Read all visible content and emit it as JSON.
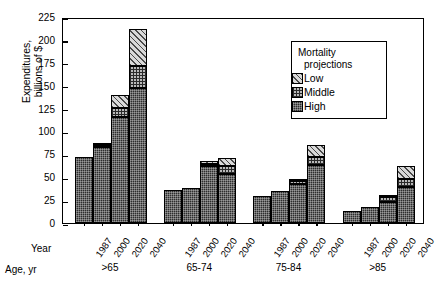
{
  "chart_data": {
    "type": "bar",
    "subtype": "grouped-stacked",
    "title": "",
    "xlabel": "",
    "ylabel": "Expenditures,\nbillions of $",
    "ylim": [
      0,
      225
    ],
    "yticks": [
      0,
      25,
      50,
      75,
      100,
      125,
      150,
      175,
      200,
      225
    ],
    "ytick_labels": [
      "0",
      "25",
      "50",
      "75",
      "100",
      "125",
      "150",
      "175",
      "200",
      "225"
    ],
    "grid": false,
    "legend": {
      "title_line1": "Mortality",
      "title_line2": "projections",
      "position": "top-right-inside",
      "entries": [
        {
          "label": "Low",
          "pattern": "diagonal-hatch",
          "color": "#d9d9d9"
        },
        {
          "label": "Middle",
          "pattern": "checkered",
          "color": "#b9b9b9"
        },
        {
          "label": "High",
          "pattern": "dark-stipple",
          "color": "#2e2e2e"
        }
      ]
    },
    "row_labels": {
      "year": "Year",
      "age": "Age, yr"
    },
    "categories": [
      "1987",
      "2000",
      "2020",
      "2040"
    ],
    "groups": [
      {
        "age_label": ">65",
        "bars": [
          {
            "year": "1987",
            "high": 72,
            "middle": 0,
            "low": 0,
            "total": 72
          },
          {
            "year": "2000",
            "high": 83,
            "middle": 2,
            "low": 1,
            "total": 86
          },
          {
            "year": "2020",
            "high": 116,
            "middle": 10,
            "low": 14,
            "total": 140
          },
          {
            "year": "2040",
            "high": 148,
            "middle": 23,
            "low": 41,
            "total": 212
          }
        ]
      },
      {
        "age_label": "65-74",
        "bars": [
          {
            "year": "1987",
            "high": 36,
            "middle": 0,
            "low": 0,
            "total": 36
          },
          {
            "year": "2000",
            "high": 38,
            "middle": 0,
            "low": 0,
            "total": 38
          },
          {
            "year": "2020",
            "high": 62,
            "middle": 3,
            "low": 3,
            "total": 68
          },
          {
            "year": "2040",
            "high": 54,
            "middle": 8,
            "low": 9,
            "total": 71
          }
        ]
      },
      {
        "age_label": "75-84",
        "bars": [
          {
            "year": "1987",
            "high": 30,
            "middle": 0,
            "low": 0,
            "total": 30
          },
          {
            "year": "2000",
            "high": 35,
            "middle": 0,
            "low": 0,
            "total": 35
          },
          {
            "year": "2020",
            "high": 43,
            "middle": 3,
            "low": 2,
            "total": 48
          },
          {
            "year": "2040",
            "high": 63,
            "middle": 9,
            "low": 13,
            "total": 85
          }
        ]
      },
      {
        "age_label": ">85",
        "bars": [
          {
            "year": "1987",
            "high": 13,
            "middle": 0,
            "low": 0,
            "total": 13
          },
          {
            "year": "2000",
            "high": 18,
            "middle": 0,
            "low": 0,
            "total": 18
          },
          {
            "year": "2020",
            "high": 23,
            "middle": 5,
            "low": 3,
            "total": 31
          },
          {
            "year": "2040",
            "high": 39,
            "middle": 9,
            "low": 14,
            "total": 62
          }
        ]
      }
    ]
  }
}
